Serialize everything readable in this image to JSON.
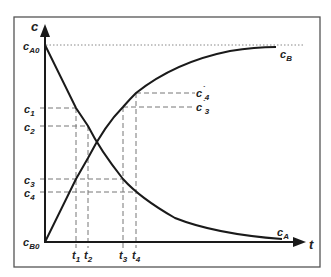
{
  "diagram": {
    "colors": {
      "ink": "#1a1a1a",
      "frame": "#555555",
      "dash": "#777777",
      "dotted": "#888888"
    },
    "axes": {
      "y_label": "c",
      "x_label": "t"
    },
    "y_labels": {
      "ca0": {
        "main": "c",
        "sub": "A0"
      },
      "c1": {
        "main": "c",
        "sub": "1"
      },
      "c2": {
        "main": "c",
        "sub": "2"
      },
      "c3": {
        "main": "c",
        "sub": "3"
      },
      "c4": {
        "main": "c",
        "sub": "4"
      },
      "cb0": {
        "main": "c",
        "sub": "B0"
      }
    },
    "right_labels": {
      "c4p": {
        "main": "c",
        "prime": "`",
        "sub": "4"
      },
      "c3p": {
        "main": "c",
        "prime": "`",
        "sub": "3"
      }
    },
    "curve_labels": {
      "cb": {
        "main": "c",
        "sub": "B"
      },
      "ca": {
        "main": "c",
        "sub": "A"
      }
    },
    "x_labels": {
      "t1": {
        "main": "t",
        "sub": "1"
      },
      "t2": {
        "main": "t",
        "sub": "2"
      },
      "t3": {
        "main": "t",
        "sub": "3"
      },
      "t4": {
        "main": "t",
        "sub": "4"
      }
    },
    "curves": [
      {
        "name": "c_A",
        "description": "decreasing from c_A0 toward 0"
      },
      {
        "name": "c_B",
        "description": "increasing from c_B0 toward c_A0"
      }
    ]
  }
}
